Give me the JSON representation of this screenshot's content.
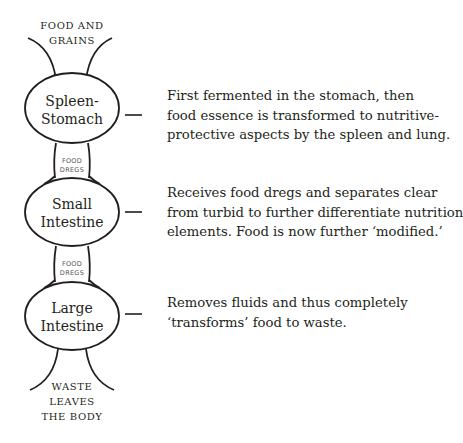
{
  "diagram": {
    "top_label": [
      "FOOD AND",
      "GRAINS"
    ],
    "bottom_label": [
      "WASTE",
      "LEAVES",
      "THE BODY"
    ],
    "organs": [
      {
        "name_lines": [
          "Spleen-",
          "Stomach"
        ],
        "description_lines": [
          "First fermented in the stomach, then",
          "food essence is transformed to nutritive-",
          "protective aspects by the spleen and lung."
        ]
      },
      {
        "name_lines": [
          "Small",
          "Intestine"
        ],
        "description_lines": [
          "Receives food dregs and separates clear",
          "from turbid to further differentiate nutrition",
          "elements. Food is now further ‘modified.’"
        ]
      },
      {
        "name_lines": [
          "Large",
          "Intestine"
        ],
        "description_lines": [
          "Removes fluids and thus completely",
          "‘transforms’ food to waste."
        ]
      }
    ],
    "connectors": [
      {
        "label_lines": [
          "FOOD",
          "DREGS"
        ]
      },
      {
        "label_lines": [
          "FOOD",
          "DREGS"
        ]
      }
    ]
  }
}
